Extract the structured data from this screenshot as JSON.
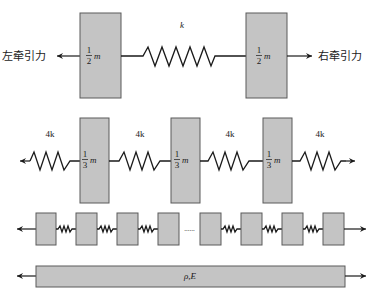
{
  "diagram": {
    "row1": {
      "left_force_label": "左牵引力",
      "right_force_label": "右牵引力",
      "spring_label": "k",
      "mass_left": {
        "numerator": "1",
        "denominator": "2",
        "symbol": "m"
      },
      "mass_right": {
        "numerator": "1",
        "denominator": "2",
        "symbol": "m"
      }
    },
    "row2": {
      "spring_labels": [
        "4k",
        "4k",
        "4k",
        "4k"
      ],
      "masses": [
        {
          "numerator": "1",
          "denominator": "3",
          "symbol": "m"
        },
        {
          "numerator": "1",
          "denominator": "3",
          "symbol": "m"
        },
        {
          "numerator": "1",
          "denominator": "3",
          "symbol": "m"
        }
      ]
    },
    "row3": {
      "mass_count": 8,
      "ellipsis": "......"
    },
    "row4": {
      "continuum_label": "ρ,E"
    },
    "colors": {
      "mass_fill": "#c4c4c4",
      "mass_stroke": "#5a5a5a",
      "line": "#1a1a1a"
    }
  }
}
